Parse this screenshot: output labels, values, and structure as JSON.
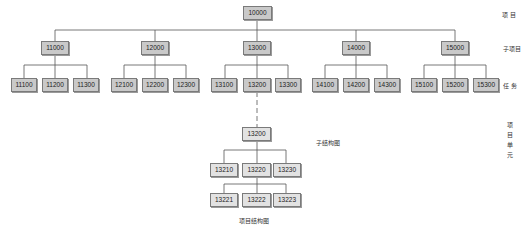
{
  "diagram": {
    "root": {
      "id": "10000"
    },
    "level1": [
      {
        "id": "11000",
        "children": [
          "11100",
          "11200",
          "11300"
        ]
      },
      {
        "id": "12000",
        "children": [
          "12100",
          "12200",
          "12300"
        ]
      },
      {
        "id": "13000",
        "children": [
          "13100",
          "13200",
          "13300"
        ]
      },
      {
        "id": "14000",
        "children": [
          "14100",
          "14200",
          "14300"
        ]
      },
      {
        "id": "15000",
        "children": [
          "15100",
          "15200",
          "15300"
        ]
      }
    ],
    "sub_structure": {
      "root": "13200",
      "level1": [
        "13210",
        "13220",
        "13230"
      ],
      "level2_parent": "13220",
      "level2": [
        "13221",
        "13222",
        "13223"
      ],
      "label": "子结构图"
    },
    "caption": "项目结构图",
    "level_labels": {
      "project": "项  目",
      "subproject": "子项目",
      "task": "任  务",
      "work_unit": [
        "项",
        "目",
        "单",
        "元"
      ]
    }
  }
}
